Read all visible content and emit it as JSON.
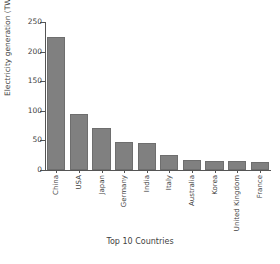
{
  "chart_data": {
    "type": "bar",
    "title": "",
    "xlabel": "Top 10 Countries",
    "ylabel": "Electricity generation (TWh)",
    "categories": [
      "China",
      "USA",
      "Japan",
      "Germany",
      "India",
      "Italy",
      "Australia",
      "Korea",
      "United Kingdom",
      "France"
    ],
    "values": [
      225,
      95,
      71,
      47,
      46,
      25,
      17,
      16,
      16,
      14
    ],
    "ylim": [
      0,
      250
    ],
    "yticks": [
      0,
      50,
      100,
      150,
      200,
      250
    ],
    "ytick_labels": [
      "0",
      "50",
      "100",
      "150",
      "200",
      "250"
    ],
    "grid": false,
    "legend": null,
    "bar_color": "#808080",
    "bar_edge_color": "#6e6e6e",
    "axis_color": "#555555",
    "text_color": "#3f3f3f",
    "background": "#ffffff"
  }
}
